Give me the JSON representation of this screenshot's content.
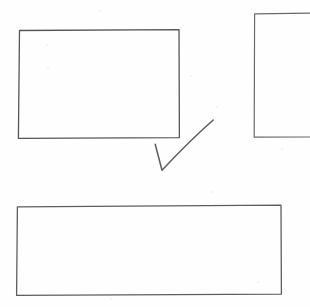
{
  "scene": {
    "title": "Hand-drawn sketch of three rectangles and a check mark",
    "medium": "pencil on white paper (scanned)",
    "canvas": {
      "width": 310,
      "height": 307
    },
    "background_color": "#fefefe",
    "ink_color": "#5a5a5a"
  },
  "shapes": [
    {
      "id": "rect-top-left",
      "name": "top-left-rectangle",
      "type": "rectangle",
      "label": "",
      "x": 19,
      "y": 30,
      "width": 160,
      "height": 108,
      "stroke_color": "#565656",
      "stroke_width": 1.3,
      "clipped": false
    },
    {
      "id": "rect-top-right",
      "name": "top-right-rectangle",
      "type": "rectangle",
      "label": "",
      "x": 254,
      "y": 13,
      "width": 60,
      "height": 124,
      "stroke_color": "#6a6a6a",
      "stroke_width": 1.2,
      "clipped": true,
      "clipped_edge": "right"
    },
    {
      "id": "rect-bottom",
      "name": "bottom-rectangle",
      "type": "rectangle",
      "label": "",
      "x": 17,
      "y": 206,
      "width": 264,
      "height": 89,
      "stroke_color": "#5e5e5e",
      "stroke_width": 1.3,
      "clipped": false
    },
    {
      "id": "check-mark",
      "name": "check-mark",
      "type": "check",
      "label": "",
      "start": {
        "x": 155,
        "y": 144
      },
      "vertex": {
        "x": 162,
        "y": 170
      },
      "end": {
        "x": 213,
        "y": 120
      },
      "stroke_color": "#5d5d5d",
      "stroke_width": 1.5
    }
  ],
  "annotations": {
    "specks": [
      {
        "x": 99,
        "y": 10,
        "size": 2
      },
      {
        "x": 47,
        "y": 67,
        "size": 2
      },
      {
        "x": 46,
        "y": 44,
        "size": 2
      },
      {
        "x": 211,
        "y": 191,
        "size": 2
      },
      {
        "x": 257,
        "y": 281,
        "size": 2
      },
      {
        "x": 190,
        "y": 75,
        "size": 2
      },
      {
        "x": 216,
        "y": 106,
        "size": 2
      },
      {
        "x": 281,
        "y": 148,
        "size": 2
      },
      {
        "x": 110,
        "y": 298,
        "size": 2
      }
    ]
  }
}
